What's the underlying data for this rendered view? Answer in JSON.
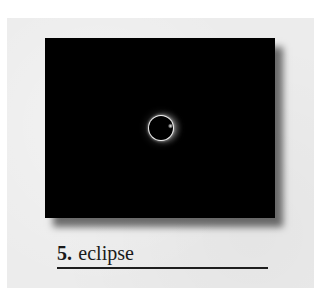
{
  "card": {
    "number": "5.",
    "title": "eclipse"
  },
  "image": {
    "subject": "solar-eclipse-diamond-ring",
    "background_color": "#000000"
  },
  "colors": {
    "page": "#ffffff",
    "panel": "#ececec",
    "text": "#1a1a1a",
    "rule": "#1e1e1e"
  }
}
